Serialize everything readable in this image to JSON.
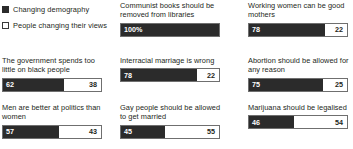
{
  "legend": {
    "items": [
      {
        "label": "Changing demography",
        "swatch": "filled-square-icon",
        "color": "#2b2b2b"
      },
      {
        "label": "People changing their views",
        "swatch": "outline-square-icon",
        "color": "#ffffff"
      }
    ]
  },
  "chart_data": {
    "type": "bar",
    "subtype": "stacked-horizontal-100pct",
    "title": "",
    "xlabel": "",
    "ylabel": "",
    "xlim": [
      0,
      100
    ],
    "grid": false,
    "legend_position": "top-left",
    "series": [
      {
        "name": "Changing demography",
        "color": "#2b2b2b"
      },
      {
        "name": "People changing their views",
        "color": "#ffffff"
      }
    ],
    "panels": [
      {
        "title": "Communist books should be removed from libraries",
        "values": [
          100,
          0
        ],
        "labels": [
          "100%",
          ""
        ]
      },
      {
        "title": "Working women can be good mothers",
        "values": [
          78,
          22
        ],
        "labels": [
          "78",
          "22"
        ]
      },
      {
        "title": "The government spends too little on black people",
        "values": [
          62,
          38
        ],
        "labels": [
          "62",
          "38"
        ]
      },
      {
        "title": "Interracial marriage is wrong",
        "values": [
          78,
          22
        ],
        "labels": [
          "78",
          "22"
        ]
      },
      {
        "title": "Abortion should be allowed for any reason",
        "values": [
          75,
          25
        ],
        "labels": [
          "75",
          "25"
        ]
      },
      {
        "title": "Men are better at politics than women",
        "values": [
          57,
          43
        ],
        "labels": [
          "57",
          "43"
        ]
      },
      {
        "title": "Gay people should be allowed to get married",
        "values": [
          45,
          55
        ],
        "labels": [
          "45",
          "55"
        ]
      },
      {
        "title": "Marijuana should be legalised",
        "values": [
          46,
          54
        ],
        "labels": [
          "46",
          "54"
        ]
      }
    ]
  }
}
